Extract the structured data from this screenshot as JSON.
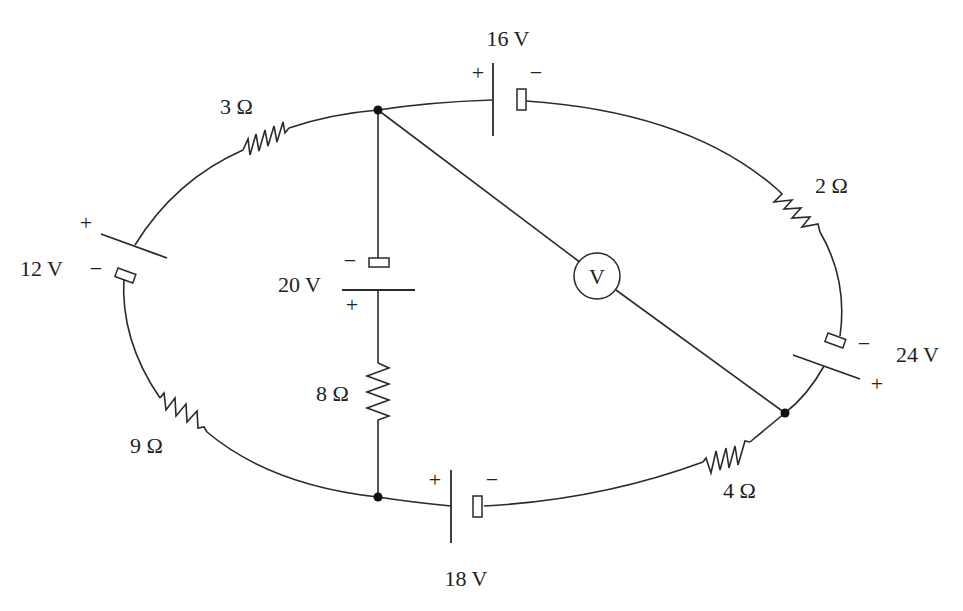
{
  "diagram": {
    "type": "circuit",
    "resistors": [
      {
        "id": "r3",
        "label": "3 Ω"
      },
      {
        "id": "r2",
        "label": "2 Ω"
      },
      {
        "id": "r9",
        "label": "9 Ω"
      },
      {
        "id": "r4",
        "label": "4 Ω"
      },
      {
        "id": "r8",
        "label": "8 Ω"
      }
    ],
    "batteries": [
      {
        "id": "b16",
        "label": "16 V",
        "plus": "+",
        "minus": "−"
      },
      {
        "id": "b12",
        "label": "12 V",
        "plus": "+",
        "minus": "−"
      },
      {
        "id": "b20",
        "label": "20 V",
        "plus": "+",
        "minus": "−"
      },
      {
        "id": "b24",
        "label": "24 V",
        "plus": "+",
        "minus": "−"
      },
      {
        "id": "b18",
        "label": "18 V",
        "plus": "+",
        "minus": "−"
      }
    ],
    "voltmeter": {
      "label": "V"
    },
    "nodes": [
      "top-junction",
      "bottom-junction",
      "right-junction"
    ]
  }
}
